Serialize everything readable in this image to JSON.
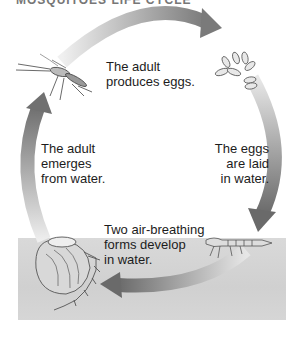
{
  "title": "MOSQUITOES LIFE CYCLE",
  "stages": [
    {
      "id": "adult-produces-eggs",
      "lines": [
        "The adult",
        "produces eggs."
      ]
    },
    {
      "id": "eggs-laid",
      "lines": [
        "The eggs",
        "are laid",
        "in water."
      ]
    },
    {
      "id": "forms-develop",
      "lines": [
        "Two air-breathing",
        "forms develop",
        "in water."
      ]
    },
    {
      "id": "adult-emerges",
      "lines": [
        "The adult",
        "emerges",
        "from water."
      ]
    }
  ],
  "illustrations": [
    "mosquito-adult",
    "eggs-cluster",
    "larva",
    "pupa"
  ],
  "colors": {
    "arrow_dark": "#6e6e6e",
    "arrow_light": "#e6e6e6",
    "water": "#d4d4d4"
  }
}
